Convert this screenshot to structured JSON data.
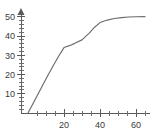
{
  "chart_data": {
    "type": "line",
    "title": "",
    "subtitle": "",
    "xlabel": "",
    "ylabel": "",
    "xlim": [
      0,
      66
    ],
    "ylim": [
      0,
      52
    ],
    "grid": false,
    "legend": null,
    "axis_style": "L-shaped axes with arrowhead on y-axis",
    "x_ticks_major": [
      20,
      40,
      60
    ],
    "x_tick_labels": [
      "20",
      "40",
      "60"
    ],
    "x_ticks_minor_step": 5,
    "y_ticks_major": [
      10,
      20,
      30,
      40,
      50
    ],
    "y_tick_labels": [
      "10",
      "20",
      "30",
      "40",
      "50"
    ],
    "y_ticks_minor_step": 2,
    "series": [
      {
        "name": "curve",
        "color": "#6b6b6b",
        "x": [
          0,
          2,
          5,
          8,
          11,
          14,
          17,
          20,
          23,
          26,
          30,
          34,
          37,
          40,
          44,
          48,
          52,
          56,
          60,
          65
        ],
        "values": [
          0,
          3.5,
          8.8,
          14.2,
          19.5,
          24.6,
          29.5,
          34,
          35,
          36.2,
          38,
          41.5,
          44.6,
          47,
          48.3,
          49.1,
          49.6,
          49.9,
          50,
          50.1
        ]
      }
    ]
  },
  "axes": {
    "y_axis_name": "vertical-axis",
    "x_axis_name": "horizontal-axis"
  }
}
